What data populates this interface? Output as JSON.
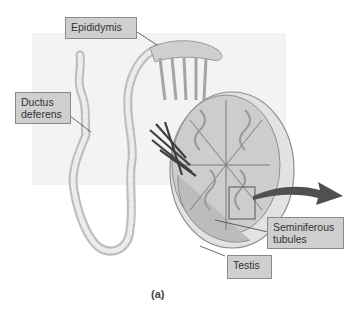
{
  "figure": {
    "caption": "(a)",
    "labels": {
      "epididymis": "Epididymis",
      "ductus_deferens": "Ductus deferens",
      "ductus_line1": "Ductus",
      "ductus_line2": "deferens",
      "seminiferous_line1": "Seminiferous",
      "seminiferous_line2": "tubules",
      "testis": "Testis"
    },
    "colors": {
      "label_fill": "#cfcfcf",
      "label_border": "#8a8a8a",
      "arrow": "#505050",
      "background_panel": "#f2f2f2"
    }
  }
}
